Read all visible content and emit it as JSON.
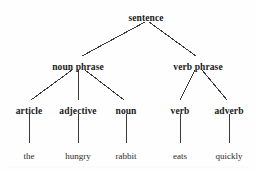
{
  "diagram": {
    "type": "syntax-tree",
    "background_color": "#fefefe",
    "line_color": "#3a3a3a",
    "text_color": "#1a1a1a",
    "nodes": [
      {
        "id": "sentence",
        "label": "sentence",
        "level": 0,
        "x": 146,
        "y": 14,
        "bold": true
      },
      {
        "id": "np",
        "label": "noun phrase",
        "level": 1,
        "x": 78,
        "y": 63,
        "bold": true
      },
      {
        "id": "vp",
        "label": "verb phrase",
        "level": 1,
        "x": 198,
        "y": 63,
        "bold": true
      },
      {
        "id": "article",
        "label": "article",
        "level": 2,
        "x": 29,
        "y": 107,
        "bold": true
      },
      {
        "id": "adjective",
        "label": "adjective",
        "level": 2,
        "x": 78,
        "y": 107,
        "bold": true
      },
      {
        "id": "noun",
        "label": "noun",
        "level": 2,
        "x": 126,
        "y": 107,
        "bold": true
      },
      {
        "id": "verb",
        "label": "verb",
        "level": 2,
        "x": 180,
        "y": 107,
        "bold": true
      },
      {
        "id": "adverb",
        "label": "adverb",
        "level": 2,
        "x": 229,
        "y": 107,
        "bold": true
      },
      {
        "id": "the",
        "label": "the",
        "level": 3,
        "x": 29,
        "y": 152,
        "bold": false
      },
      {
        "id": "hungry",
        "label": "hungry",
        "level": 3,
        "x": 78,
        "y": 152,
        "bold": false
      },
      {
        "id": "rabbit",
        "label": "rabbit",
        "level": 3,
        "x": 126,
        "y": 152,
        "bold": false
      },
      {
        "id": "eats",
        "label": "eats",
        "level": 3,
        "x": 180,
        "y": 152,
        "bold": false
      },
      {
        "id": "quickly",
        "label": "quickly",
        "level": 3,
        "x": 229,
        "y": 152,
        "bold": false
      }
    ],
    "edges": [
      {
        "from": "sentence",
        "to": "np",
        "x1": 145,
        "y1": 22,
        "x2": 82,
        "y2": 56
      },
      {
        "from": "sentence",
        "to": "vp",
        "x1": 149,
        "y1": 22,
        "x2": 196,
        "y2": 56
      },
      {
        "from": "np",
        "to": "article",
        "x1": 72,
        "y1": 70,
        "x2": 31,
        "y2": 100
      },
      {
        "from": "np",
        "to": "adjective",
        "x1": 78,
        "y1": 70,
        "x2": 78,
        "y2": 100
      },
      {
        "from": "np",
        "to": "noun",
        "x1": 85,
        "y1": 70,
        "x2": 124,
        "y2": 100
      },
      {
        "from": "vp",
        "to": "verb",
        "x1": 195,
        "y1": 70,
        "x2": 180,
        "y2": 100
      },
      {
        "from": "vp",
        "to": "adverb",
        "x1": 202,
        "y1": 70,
        "x2": 227,
        "y2": 100
      },
      {
        "from": "article",
        "to": "the",
        "x1": 29,
        "y1": 114,
        "x2": 29,
        "y2": 143
      },
      {
        "from": "adjective",
        "to": "hungry",
        "x1": 78,
        "y1": 114,
        "x2": 78,
        "y2": 143
      },
      {
        "from": "noun",
        "to": "rabbit",
        "x1": 126,
        "y1": 114,
        "x2": 126,
        "y2": 143
      },
      {
        "from": "verb",
        "to": "eats",
        "x1": 180,
        "y1": 114,
        "x2": 180,
        "y2": 143
      },
      {
        "from": "adverb",
        "to": "quickly",
        "x1": 229,
        "y1": 114,
        "x2": 229,
        "y2": 143
      }
    ]
  }
}
